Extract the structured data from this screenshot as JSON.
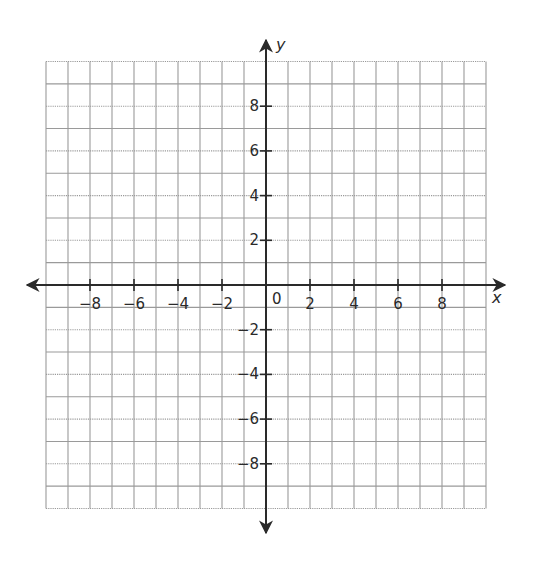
{
  "diagram": {
    "type": "coordinate-plane",
    "axes": {
      "x": {
        "label": "x",
        "min": -10,
        "max": 10,
        "tick_step": 2
      },
      "y": {
        "label": "y",
        "min": -10,
        "max": 10,
        "tick_step": 2
      }
    },
    "origin_label": "0",
    "grid": {
      "cells_x": 20,
      "cells_y": 20,
      "unit_per_cell": 1,
      "line_style": "dotted"
    },
    "x_tick_labels": [
      "−8",
      "−6",
      "−4",
      "−2",
      "2",
      "4",
      "6",
      "8"
    ],
    "x_tick_values": [
      -8,
      -6,
      -4,
      -2,
      2,
      4,
      6,
      8
    ],
    "y_tick_labels": [
      "8",
      "6",
      "4",
      "2",
      "−2",
      "−4",
      "−6",
      "−8"
    ],
    "y_tick_values": [
      8,
      6,
      4,
      2,
      -2,
      -4,
      -6,
      -8
    ],
    "colors": {
      "grid": "#9a9a9a",
      "axis": "#2a2a2a",
      "background": "#ffffff"
    }
  }
}
